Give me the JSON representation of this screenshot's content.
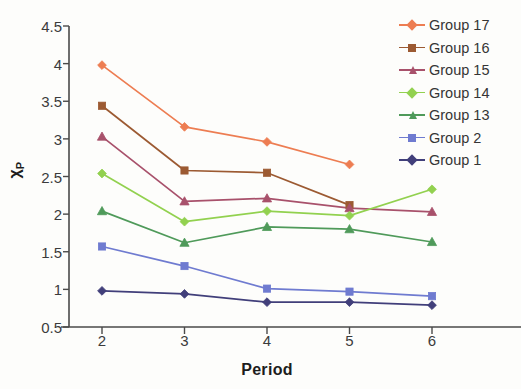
{
  "chart_data": {
    "type": "line",
    "title": "",
    "xlabel": "Period",
    "ylabel": "χP",
    "ylabel_main": "χ",
    "ylabel_sub": "P",
    "x": [
      2,
      3,
      4,
      5,
      6
    ],
    "xticklabels": [
      "2",
      "3",
      "4",
      "5",
      "6"
    ],
    "yticklabels": [
      "0.5",
      "1",
      "1.5",
      "2",
      "2.5",
      "3",
      "3.5",
      "4",
      "4.5"
    ],
    "ytickvalues": [
      0.5,
      1,
      1.5,
      2,
      2.5,
      3,
      3.5,
      4,
      4.5
    ],
    "xlim": [
      1.6,
      6.4
    ],
    "ylim": [
      0.5,
      4.5
    ],
    "grid": false,
    "legend_position": "right-top",
    "series": [
      {
        "name": "Group 17",
        "color": "#ed7d52",
        "marker": "diamond",
        "x": [
          2,
          3,
          4,
          5
        ],
        "values": [
          3.98,
          3.16,
          2.96,
          2.66
        ]
      },
      {
        "name": "Group 16",
        "color": "#9c5a32",
        "marker": "square",
        "x": [
          2,
          3,
          4,
          5
        ],
        "values": [
          3.44,
          2.58,
          2.55,
          2.12
        ]
      },
      {
        "name": "Group 15",
        "color": "#a8516b",
        "marker": "triangle",
        "x": [
          2,
          3,
          4,
          5,
          6
        ],
        "values": [
          3.03,
          2.17,
          2.21,
          2.08,
          2.03
        ]
      },
      {
        "name": "Group 14",
        "color": "#92d14f",
        "marker": "diamond",
        "x": [
          2,
          3,
          4,
          5,
          6
        ],
        "values": [
          2.54,
          1.9,
          2.04,
          1.98,
          2.33
        ]
      },
      {
        "name": "Group 13",
        "color": "#4f9a5a",
        "marker": "triangle",
        "x": [
          2,
          3,
          4,
          5,
          6
        ],
        "values": [
          2.04,
          1.62,
          1.83,
          1.8,
          1.63
        ]
      },
      {
        "name": "Group 2",
        "color": "#6f7bd0",
        "marker": "square",
        "x": [
          2,
          3,
          4,
          5,
          6
        ],
        "values": [
          1.57,
          1.31,
          1.01,
          0.97,
          0.91
        ]
      },
      {
        "name": "Group 1",
        "color": "#413f7a",
        "marker": "diamond",
        "x": [
          2,
          3,
          4,
          5,
          6
        ],
        "values": [
          0.98,
          0.94,
          0.83,
          0.83,
          0.79
        ]
      }
    ]
  },
  "axis": {
    "line_color": "#4a4a4a",
    "x_title": "Period",
    "y_title": "χP"
  }
}
